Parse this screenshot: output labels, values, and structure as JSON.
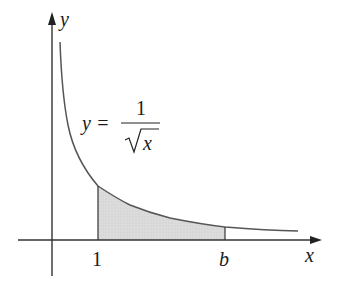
{
  "diagram": {
    "type": "function-graph-with-shaded-area",
    "function": {
      "label_lhs": "y =",
      "numerator": "1",
      "radicand": "x",
      "description": "y = 1/sqrt(x)"
    },
    "axes": {
      "x_label": "x",
      "y_label": "y"
    },
    "ticks": {
      "lower_bound_label": "1",
      "upper_bound_label": "b"
    },
    "shaded_region": {
      "from": "1",
      "to": "b",
      "fill": "#dcdcdc"
    },
    "colors": {
      "axis": "#333333",
      "curve": "#555555",
      "shade": "#dcdcdc",
      "text": "#1a1a1a"
    }
  }
}
